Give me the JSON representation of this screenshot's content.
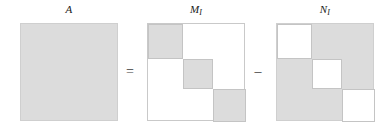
{
  "figure": {
    "type": "matrix-decomposition-diagram",
    "background_color": "#ffffff",
    "fill_color": "#dcdcdc",
    "border_color": "#c9c9c9",
    "matrices": [
      {
        "id": "A",
        "label_main": "A",
        "label_sub": "",
        "left": 20,
        "fill": "solid",
        "blocks": []
      },
      {
        "id": "M_I",
        "label_main": "M",
        "label_sub": "I",
        "left": 147,
        "fill": "blocks",
        "blocks": [
          {
            "left": 0,
            "top": 0,
            "width": 35,
            "height": 35,
            "kind": "filled"
          },
          {
            "left": 35,
            "top": 35,
            "width": 30,
            "height": 30,
            "kind": "filled"
          },
          {
            "left": 65,
            "top": 65,
            "width": 33,
            "height": 33,
            "kind": "filled"
          }
        ]
      },
      {
        "id": "N_I",
        "label_main": "N",
        "label_sub": "I",
        "left": 276,
        "fill": "solid",
        "blocks": [
          {
            "left": 0,
            "top": 0,
            "width": 35,
            "height": 35,
            "kind": "hole"
          },
          {
            "left": 35,
            "top": 35,
            "width": 30,
            "height": 30,
            "kind": "hole"
          },
          {
            "left": 65,
            "top": 65,
            "width": 33,
            "height": 33,
            "kind": "hole"
          }
        ]
      }
    ],
    "operators": [
      {
        "id": "equals",
        "symbol": "=",
        "left": 119
      },
      {
        "id": "minus",
        "symbol": "–",
        "left": 247
      }
    ]
  }
}
